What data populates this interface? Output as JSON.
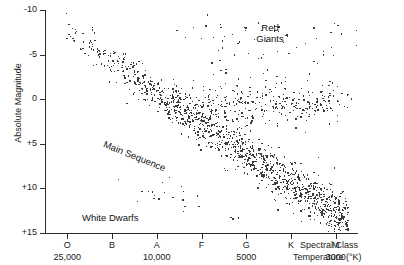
{
  "chart_data": {
    "type": "scatter",
    "title": "",
    "xlabel": "Spectral Class",
    "xlabel2": "Temperature (°K)",
    "ylabel": "Absolute Magnitude",
    "grid": false,
    "legend": "none",
    "x_axis": {
      "categories": [
        "O",
        "B",
        "A",
        "F",
        "G",
        "K",
        "M"
      ],
      "temperatures": [
        "25,000",
        "",
        "10,000",
        "",
        "5000",
        "",
        "3000"
      ],
      "temp_ticks": [
        {
          "class": "O",
          "temp": "25,000"
        },
        {
          "class": "A",
          "temp": "10,000"
        },
        {
          "class": "G",
          "temp": "5000"
        },
        {
          "class": "M",
          "temp": "3000"
        }
      ],
      "direction": "hot-to-cool"
    },
    "y_axis": {
      "ticks": [
        "-10",
        "-5",
        "0",
        "+5",
        "+10",
        "+15"
      ],
      "values": [
        -10,
        -5,
        0,
        5,
        10,
        15
      ],
      "ylim": [
        -10,
        15
      ],
      "inverted": true
    },
    "annotations": [
      {
        "id": "red-giants",
        "text": "Red\nGiants",
        "x_class": "K",
        "y_mag": -7.5
      },
      {
        "id": "main-sequence",
        "text": "Main Sequence",
        "x_class": "A",
        "y_mag": 4.5,
        "rotation": 22
      },
      {
        "id": "white-dwarfs",
        "text": "White Dwarfs",
        "x_class": "B",
        "y_mag": 12.5
      }
    ],
    "populations": [
      {
        "name": "Main Sequence",
        "description": "Dense diagonal band from upper-left (hot, bright) to lower-right (cool, faint)",
        "approx_count": 1150
      },
      {
        "name": "Red Giants",
        "description": "Clump near absolute magnitude 0 to +2 in spectral classes G through M",
        "approx_count": 360
      },
      {
        "name": "Supergiants",
        "description": "Sparse scatter near magnitude -8 to -3 across K and M",
        "approx_count": 55
      },
      {
        "name": "White Dwarfs",
        "description": "Sparse band from magnitude +9 to +14 in classes B through F",
        "approx_count": 22
      }
    ],
    "point_color": "#3a3a3a",
    "point_size_px": 1.4,
    "total_points": 1587
  },
  "axis_titles": {
    "y": "Absolute Magnitude",
    "x_class": "Spectral Class",
    "x_temp": "Temperature (°K)"
  },
  "labels": {
    "red_giants": "Red\nGiants",
    "main_sequence": "Main Sequence",
    "white_dwarfs": "White Dwarfs"
  },
  "colors": {
    "axis": "#2b2b2b",
    "text": "#1a1a1a",
    "point": "#3a3a3a",
    "background": "#ffffff"
  }
}
